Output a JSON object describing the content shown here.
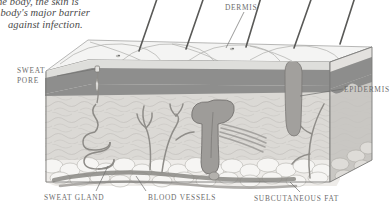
{
  "figure": {
    "title_caption": {
      "line1": "the body, the skin is",
      "line2": "e body's major barrier",
      "line3": "against infection."
    },
    "labels": {
      "sweat_pore_line1": "SWEAT",
      "sweat_pore_line2": "PORE",
      "dermis": "DERMIS",
      "epidermis": "EPIDERMIS",
      "sweat_gland": "SWEAT GLAND",
      "blood_vessels": "BLOOD VESSELS",
      "subcutaneous_fat": "SUBCUTANEOUS FAT"
    },
    "colors": {
      "background": "#ffffff",
      "surface_top": "#f2f2f1",
      "epidermis_upper": "#cfcfcd",
      "epidermis_lower": "#8c8c8c",
      "dermis": "#d6d5d2",
      "fat": "#eceae7",
      "hair": "#6a6a6a",
      "follicle": "#9a9a9a",
      "vessel": "#8f8f8f",
      "outline": "#6b6b6b",
      "label_text": "#6d6d6d",
      "caption_text": "#4a4a4a"
    },
    "structures": [
      "hair-shaft",
      "skin-surface-ridges",
      "sweat-pore",
      "epidermis-layer",
      "dermis-layer",
      "hair-follicle-bulb",
      "arrector-pili-muscle",
      "sweat-gland-coil",
      "sweat-duct",
      "blood-vessel-network",
      "subcutaneous-fat-lobules"
    ],
    "hair_count": 5
  }
}
